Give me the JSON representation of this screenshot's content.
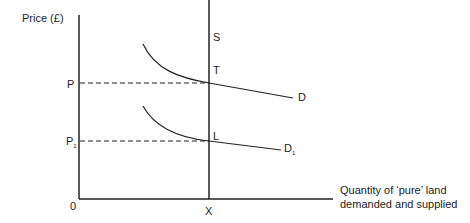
{
  "diagram": {
    "y_axis_label": "Price (£)",
    "x_axis_label_line1": "Quantity of ‘pure’ land",
    "x_axis_label_line2": "demanded and supplied",
    "origin_label": "0",
    "price_labels": {
      "p": "P",
      "p1": "P",
      "p1_sub": "1"
    },
    "quantity_label": "X",
    "supply_label": "S",
    "point_labels": {
      "t": "T",
      "l": "L"
    },
    "demand_labels": {
      "d": "D",
      "d1": "D",
      "d1_sub": "1"
    },
    "line_color": "#222222"
  }
}
